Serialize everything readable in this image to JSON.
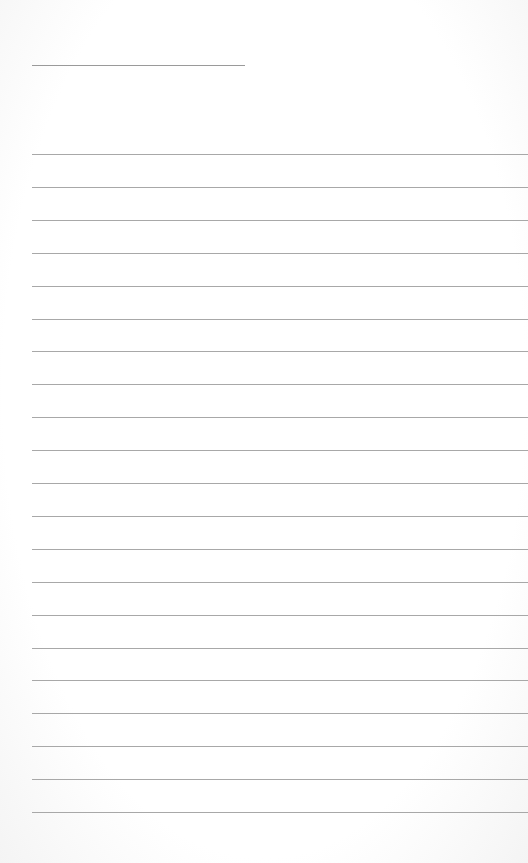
{
  "page": {
    "type": "blank-lined-paper",
    "background_color": "#ffffff",
    "line_color": "#a8a8a8",
    "header_line": {
      "top": 65,
      "left": 32,
      "width": 213
    },
    "rules": {
      "count": 21,
      "first_top": 154,
      "spacing": 32.9,
      "left": 32
    }
  }
}
